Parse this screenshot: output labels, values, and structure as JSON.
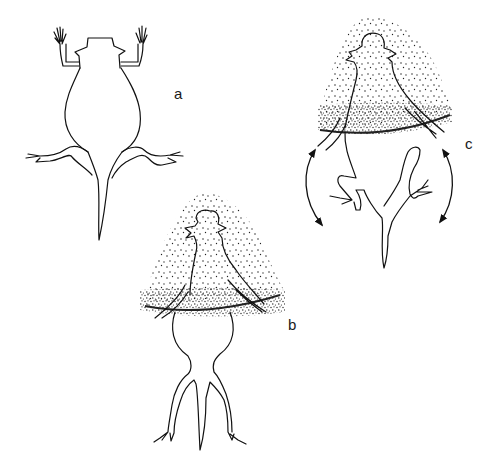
{
  "figure": {
    "panels": [
      {
        "id": "a",
        "label": "a",
        "description": "Lizard resting on surface, limbs spread"
      },
      {
        "id": "b",
        "label": "b",
        "description": "Anterior half buried beneath stippled sand, hind limbs extended"
      },
      {
        "id": "c",
        "label": "c",
        "description": "Anterior half buried; hind limbs flexed with curved double-headed arrows showing lateral shimmy motion"
      }
    ],
    "colors": {
      "line": "#111111",
      "stipple": "#222222",
      "background": "#ffffff"
    }
  }
}
